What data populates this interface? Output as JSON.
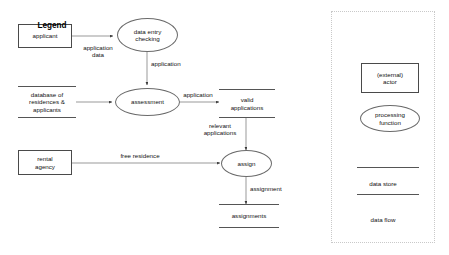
{
  "diagram": {
    "type": "data-flow-diagram",
    "title": "",
    "external_actors": [
      {
        "id": "applicant",
        "label": "applicant"
      },
      {
        "id": "rental-agency",
        "label": "rental\nagency"
      }
    ],
    "processes": [
      {
        "id": "data-entry-checking",
        "label": "data entry\nchecking"
      },
      {
        "id": "assessment",
        "label": "assessment"
      },
      {
        "id": "assign",
        "label": "assign"
      }
    ],
    "data_stores": [
      {
        "id": "database-of-residences-applicants",
        "label": "database of\nresidences &\napplicants"
      },
      {
        "id": "valid-applications",
        "label": "valid\napplications"
      },
      {
        "id": "assignments",
        "label": "assignments"
      }
    ],
    "data_flows": [
      {
        "id": "application-data",
        "label": "application\ndata",
        "from": "applicant",
        "to": "data-entry-checking"
      },
      {
        "id": "application-to-assessment",
        "label": "application",
        "from": "data-entry-checking",
        "to": "assessment"
      },
      {
        "id": "database-to-assessment",
        "label": "",
        "from": "database-of-residences-applicants",
        "to": "assessment"
      },
      {
        "id": "application-to-valid",
        "label": "application",
        "from": "assessment",
        "to": "valid-applications"
      },
      {
        "id": "relevant-applications",
        "label": "relevant\napplications",
        "from": "valid-applications",
        "to": "assign"
      },
      {
        "id": "free-residence",
        "label": "free residence",
        "from": "rental-agency",
        "to": "assign"
      },
      {
        "id": "assignment",
        "label": "assignment",
        "from": "assign",
        "to": "assignments"
      }
    ]
  },
  "legend": {
    "title": "Legend",
    "items": [
      {
        "id": "external-actor",
        "label": "(external)\nactor",
        "shape": "rectangle"
      },
      {
        "id": "processing-function",
        "label": "processing\nfunction",
        "shape": "ellipse"
      },
      {
        "id": "data-store",
        "label": "data store",
        "shape": "open-box"
      },
      {
        "id": "data-flow",
        "label": "data flow",
        "shape": "arrow"
      }
    ]
  },
  "colors": {
    "background": "#ffffff",
    "stroke": "#555555",
    "text": "#111111",
    "legend_border": "#c9c9c9"
  }
}
